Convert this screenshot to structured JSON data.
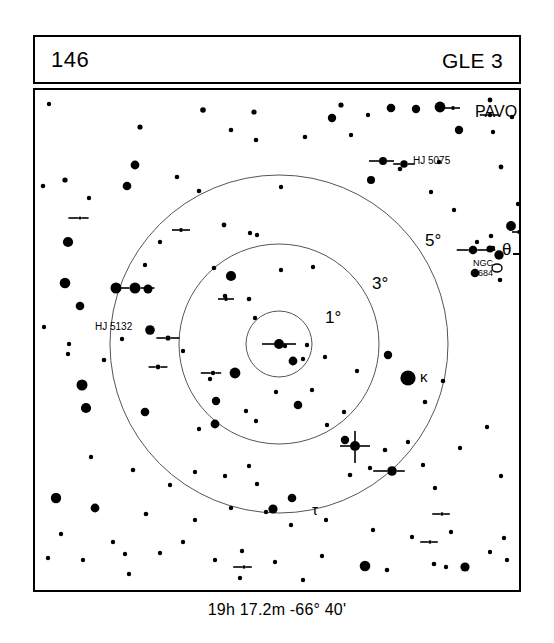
{
  "header": {
    "chart_number": "146",
    "chart_code": "GLE 3"
  },
  "footer": {
    "coordinates": "19h 17.2m  -66° 40'"
  },
  "chart_data": {
    "type": "scatter",
    "title": "146",
    "subtitle": "GLE 3",
    "constellation": "PAVO",
    "center_coordinates": "19h 17.2m  -66° 40'",
    "grid": false,
    "legend": "none",
    "field_center": {
      "x": 244,
      "y": 254
    },
    "circle_scale_px_per_degree": 38.5,
    "circles": [
      {
        "label": "1°",
        "degrees": 1,
        "radius_px": 33,
        "label_x": 290,
        "label_y": 233
      },
      {
        "label": "3°",
        "degrees": 3,
        "radius_px": 100,
        "label_x": 337,
        "label_y": 199
      },
      {
        "label": "5°",
        "degrees": 5,
        "radius_px": 169,
        "label_x": 390,
        "label_y": 156
      }
    ],
    "labels": [
      {
        "text": "PAVO",
        "x": 440,
        "y": 27,
        "size": 16
      },
      {
        "text": "HJ 5075",
        "x": 378,
        "y": 74,
        "size": 10
      },
      {
        "text": "HJ 5132",
        "x": 60,
        "y": 240,
        "size": 10
      },
      {
        "text": "NGC",
        "x": 438,
        "y": 176,
        "size": 9
      },
      {
        "text": "6684",
        "x": 438,
        "y": 186,
        "size": 9
      },
      {
        "text": "θ",
        "x": 467,
        "y": 165,
        "size": 17
      },
      {
        "text": "κ",
        "x": 385,
        "y": 292,
        "size": 15
      },
      {
        "text": "τ",
        "x": 277,
        "y": 425,
        "size": 15
      }
    ],
    "deep_sky_objects": [
      {
        "name": "NGC 6684",
        "type": "galaxy",
        "x": 462,
        "y": 178,
        "rx": 5,
        "ry": 4
      }
    ],
    "stars": [
      {
        "x": 14,
        "y": 14,
        "r": 2.2
      },
      {
        "x": 168,
        "y": 20,
        "r": 2.8
      },
      {
        "x": 219,
        "y": 22,
        "r": 2.6
      },
      {
        "x": 297,
        "y": 28,
        "r": 4.2
      },
      {
        "x": 306,
        "y": 15,
        "r": 2.6
      },
      {
        "x": 356,
        "y": 18,
        "r": 4.3
      },
      {
        "x": 381,
        "y": 19,
        "r": 4.2
      },
      {
        "x": 405,
        "y": 17,
        "r": 5.4
      },
      {
        "x": 333,
        "y": 25,
        "r": 2.2
      },
      {
        "x": 455,
        "y": 10,
        "r": 2.4
      },
      {
        "x": 477,
        "y": 27,
        "r": 2.3
      },
      {
        "x": 105,
        "y": 37,
        "r": 2.6
      },
      {
        "x": 424,
        "y": 40,
        "r": 4.2
      },
      {
        "x": 316,
        "y": 45,
        "r": 2.2
      },
      {
        "x": 196,
        "y": 40,
        "r": 2.3
      },
      {
        "x": 458,
        "y": 42,
        "r": 2.2
      },
      {
        "x": 487,
        "y": 12,
        "r": 2.5
      },
      {
        "x": 221,
        "y": 50,
        "r": 2.3
      },
      {
        "x": 270,
        "y": 47,
        "r": 2.3
      },
      {
        "x": 100,
        "y": 75,
        "r": 4.4
      },
      {
        "x": 142,
        "y": 87,
        "r": 2.3
      },
      {
        "x": 365,
        "y": 79,
        "r": 2.3
      },
      {
        "x": 404,
        "y": 72,
        "r": 2.2
      },
      {
        "x": 8,
        "y": 96,
        "r": 2.3
      },
      {
        "x": 30,
        "y": 90,
        "r": 2.6
      },
      {
        "x": 54,
        "y": 108,
        "r": 2.2
      },
      {
        "x": 336,
        "y": 90,
        "r": 4.0
      },
      {
        "x": 466,
        "y": 77,
        "r": 2.4
      },
      {
        "x": 246,
        "y": 97,
        "r": 2.2
      },
      {
        "x": 92,
        "y": 96,
        "r": 4.3
      },
      {
        "x": 483,
        "y": 114,
        "r": 2.2
      },
      {
        "x": 396,
        "y": 102,
        "r": 2.2
      },
      {
        "x": 419,
        "y": 120,
        "r": 2.2
      },
      {
        "x": 125,
        "y": 152,
        "r": 2.2
      },
      {
        "x": 33,
        "y": 152,
        "r": 5.1
      },
      {
        "x": 164,
        "y": 101,
        "r": 2.3
      },
      {
        "x": 189,
        "y": 135,
        "r": 2.4
      },
      {
        "x": 215,
        "y": 143,
        "r": 2.2
      },
      {
        "x": 222,
        "y": 145,
        "r": 2.2
      },
      {
        "x": 456,
        "y": 146,
        "r": 2.3
      },
      {
        "x": 458,
        "y": 158,
        "r": 2.2
      },
      {
        "x": 476,
        "y": 136,
        "r": 4.9
      },
      {
        "x": 495,
        "y": 133,
        "r": 2.4
      },
      {
        "x": 497,
        "y": 146,
        "r": 5.2
      },
      {
        "x": 442,
        "y": 152,
        "r": 2.2
      },
      {
        "x": 30,
        "y": 193,
        "r": 5.3
      },
      {
        "x": 110,
        "y": 175,
        "r": 2.2
      },
      {
        "x": 179,
        "y": 178,
        "r": 2.3
      },
      {
        "x": 81,
        "y": 198,
        "r": 5.5
      },
      {
        "x": 113,
        "y": 199,
        "r": 4.5
      },
      {
        "x": 45,
        "y": 216,
        "r": 4.3
      },
      {
        "x": 196,
        "y": 186,
        "r": 5.1
      },
      {
        "x": 190,
        "y": 206,
        "r": 2.3
      },
      {
        "x": 214,
        "y": 209,
        "r": 2.3
      },
      {
        "x": 246,
        "y": 180,
        "r": 2.2
      },
      {
        "x": 278,
        "y": 177,
        "r": 2.2
      },
      {
        "x": 220,
        "y": 228,
        "r": 2.2
      },
      {
        "x": 465,
        "y": 190,
        "r": 2.3
      },
      {
        "x": 440,
        "y": 183,
        "r": 4.3
      },
      {
        "x": 464,
        "y": 165,
        "r": 4.7
      },
      {
        "x": 455,
        "y": 159,
        "r": 3.6
      },
      {
        "x": 250,
        "y": 256,
        "r": 2.2
      },
      {
        "x": 272,
        "y": 255,
        "r": 2.2
      },
      {
        "x": 87,
        "y": 249,
        "r": 2.2
      },
      {
        "x": 258,
        "y": 271,
        "r": 4.4
      },
      {
        "x": 268,
        "y": 269,
        "r": 2.2
      },
      {
        "x": 290,
        "y": 267,
        "r": 2.2
      },
      {
        "x": 148,
        "y": 261,
        "r": 2.2
      },
      {
        "x": 115,
        "y": 240,
        "r": 4.8
      },
      {
        "x": 353,
        "y": 265,
        "r": 4.2
      },
      {
        "x": 69,
        "y": 270,
        "r": 2.3
      },
      {
        "x": 373,
        "y": 288,
        "r": 7.6
      },
      {
        "x": 322,
        "y": 281,
        "r": 2.2
      },
      {
        "x": 408,
        "y": 291,
        "r": 2.3
      },
      {
        "x": 241,
        "y": 302,
        "r": 2.2
      },
      {
        "x": 277,
        "y": 300,
        "r": 2.2
      },
      {
        "x": 390,
        "y": 312,
        "r": 2.3
      },
      {
        "x": 9,
        "y": 237,
        "r": 2.2
      },
      {
        "x": 34,
        "y": 254,
        "r": 2.2
      },
      {
        "x": 33,
        "y": 264,
        "r": 2.2
      },
      {
        "x": 175,
        "y": 289,
        "r": 2.2
      },
      {
        "x": 200,
        "y": 283,
        "r": 5.4
      },
      {
        "x": 47,
        "y": 295,
        "r": 5.5
      },
      {
        "x": 211,
        "y": 321,
        "r": 2.2
      },
      {
        "x": 51,
        "y": 318,
        "r": 5.1
      },
      {
        "x": 110,
        "y": 322,
        "r": 4.3
      },
      {
        "x": 164,
        "y": 339,
        "r": 2.2
      },
      {
        "x": 292,
        "y": 335,
        "r": 2.2
      },
      {
        "x": 309,
        "y": 322,
        "r": 2.2
      },
      {
        "x": 181,
        "y": 311,
        "r": 4.2
      },
      {
        "x": 180,
        "y": 334,
        "r": 4.4
      },
      {
        "x": 263,
        "y": 315,
        "r": 4.3
      },
      {
        "x": 221,
        "y": 331,
        "r": 2.2
      },
      {
        "x": 310,
        "y": 350,
        "r": 4.2
      },
      {
        "x": 350,
        "y": 360,
        "r": 2.3
      },
      {
        "x": 373,
        "y": 352,
        "r": 2.2
      },
      {
        "x": 425,
        "y": 358,
        "r": 2.2
      },
      {
        "x": 452,
        "y": 337,
        "r": 2.2
      },
      {
        "x": 500,
        "y": 339,
        "r": 2.2
      },
      {
        "x": 238,
        "y": 419,
        "r": 4.6
      },
      {
        "x": 257,
        "y": 408,
        "r": 4.3
      },
      {
        "x": 190,
        "y": 386,
        "r": 2.2
      },
      {
        "x": 214,
        "y": 376,
        "r": 2.2
      },
      {
        "x": 56,
        "y": 367,
        "r": 2.2
      },
      {
        "x": 98,
        "y": 380,
        "r": 2.3
      },
      {
        "x": 135,
        "y": 395,
        "r": 2.2
      },
      {
        "x": 160,
        "y": 382,
        "r": 2.2
      },
      {
        "x": 222,
        "y": 394,
        "r": 2.2
      },
      {
        "x": 315,
        "y": 385,
        "r": 2.3
      },
      {
        "x": 335,
        "y": 378,
        "r": 2.2
      },
      {
        "x": 388,
        "y": 375,
        "r": 2.2
      },
      {
        "x": 400,
        "y": 398,
        "r": 2.2
      },
      {
        "x": 466,
        "y": 386,
        "r": 2.2
      },
      {
        "x": 21,
        "y": 408,
        "r": 5.2
      },
      {
        "x": 60,
        "y": 418,
        "r": 4.4
      },
      {
        "x": 111,
        "y": 424,
        "r": 2.3
      },
      {
        "x": 160,
        "y": 430,
        "r": 2.2
      },
      {
        "x": 196,
        "y": 418,
        "r": 2.2
      },
      {
        "x": 231,
        "y": 422,
        "r": 2.2
      },
      {
        "x": 256,
        "y": 435,
        "r": 2.2
      },
      {
        "x": 291,
        "y": 430,
        "r": 2.2
      },
      {
        "x": 338,
        "y": 440,
        "r": 2.2
      },
      {
        "x": 377,
        "y": 447,
        "r": 2.2
      },
      {
        "x": 416,
        "y": 442,
        "r": 2.2
      },
      {
        "x": 469,
        "y": 448,
        "r": 2.2
      },
      {
        "x": 26,
        "y": 444,
        "r": 2.2
      },
      {
        "x": 78,
        "y": 452,
        "r": 2.2
      },
      {
        "x": 13,
        "y": 468,
        "r": 2.2
      },
      {
        "x": 48,
        "y": 470,
        "r": 2.2
      },
      {
        "x": 90,
        "y": 464,
        "r": 2.2
      },
      {
        "x": 125,
        "y": 463,
        "r": 2.2
      },
      {
        "x": 148,
        "y": 452,
        "r": 2.2
      },
      {
        "x": 180,
        "y": 470,
        "r": 2.2
      },
      {
        "x": 207,
        "y": 461,
        "r": 2.2
      },
      {
        "x": 240,
        "y": 472,
        "r": 2.2
      },
      {
        "x": 287,
        "y": 466,
        "r": 2.2
      },
      {
        "x": 330,
        "y": 476,
        "r": 5.3
      },
      {
        "x": 352,
        "y": 480,
        "r": 2.3
      },
      {
        "x": 399,
        "y": 474,
        "r": 2.3
      },
      {
        "x": 411,
        "y": 477,
        "r": 2.2
      },
      {
        "x": 430,
        "y": 477,
        "r": 4.6
      },
      {
        "x": 455,
        "y": 462,
        "r": 2.2
      },
      {
        "x": 472,
        "y": 470,
        "r": 2.2
      },
      {
        "x": 94,
        "y": 484,
        "r": 2.2
      },
      {
        "x": 205,
        "y": 488,
        "r": 2.2
      },
      {
        "x": 268,
        "y": 490,
        "r": 2.2
      }
    ],
    "double_stars": [
      {
        "x": 100,
        "y": 198,
        "r": 5.5,
        "tick_left": 14,
        "tick_right": 14
      },
      {
        "x": 45,
        "y": 128,
        "r": 1.6,
        "tick_left": 10,
        "tick_right": 7
      },
      {
        "x": 133,
        "y": 248,
        "r": 2.6,
        "tick_left": 9,
        "tick_right": 9
      },
      {
        "x": 123,
        "y": 277,
        "r": 2.4,
        "tick_left": 7,
        "tick_right": 7
      },
      {
        "x": 348,
        "y": 71,
        "r": 4.0,
        "tick_left": 10,
        "tick_right": 7
      },
      {
        "x": 369,
        "y": 74,
        "r": 3.8,
        "tick_left": 7,
        "tick_right": 7
      },
      {
        "x": 178,
        "y": 283,
        "r": 2.2,
        "tick_left": 10,
        "tick_right": 6
      },
      {
        "x": 455,
        "y": 25,
        "r": 2.2,
        "tick_left": 8,
        "tick_right": 6
      },
      {
        "x": 438,
        "y": 160,
        "r": 4.3,
        "tick_left": 12,
        "tick_right": 18
      },
      {
        "x": 191,
        "y": 209,
        "r": 2.0,
        "tick_left": 6,
        "tick_right": 6
      },
      {
        "x": 146,
        "y": 140,
        "r": 2.0,
        "tick_left": 7,
        "tick_right": 7
      },
      {
        "x": 320,
        "y": 356,
        "r": 5.0,
        "tick_left": 10,
        "tick_right": 10,
        "tick_up": 10,
        "tick_down": 12
      },
      {
        "x": 357,
        "y": 381,
        "r": 4.8,
        "tick_left": 14,
        "tick_right": 8
      },
      {
        "x": 209,
        "y": 477,
        "r": 1.8,
        "tick_left": 9,
        "tick_right": 6
      },
      {
        "x": 484,
        "y": 142,
        "r": 2.0,
        "tick_left": 5,
        "tick_right": 8
      },
      {
        "x": 244,
        "y": 254,
        "r": 5.0,
        "tick_left": 12,
        "tick_right": 12
      },
      {
        "x": 407,
        "y": 424,
        "r": 1.8,
        "tick_left": 8,
        "tick_right": 6
      },
      {
        "x": 395,
        "y": 452,
        "r": 1.8,
        "tick_left": 8,
        "tick_right": 6
      },
      {
        "x": 418,
        "y": 18,
        "r": 2.0,
        "tick_left": 7,
        "tick_right": 5
      }
    ],
    "edge_ticks": [
      {
        "edge": "right",
        "x": 478,
        "y": 164,
        "length": 8
      },
      {
        "edge": "left",
        "x": 0,
        "y": 408,
        "length": 7
      }
    ]
  }
}
